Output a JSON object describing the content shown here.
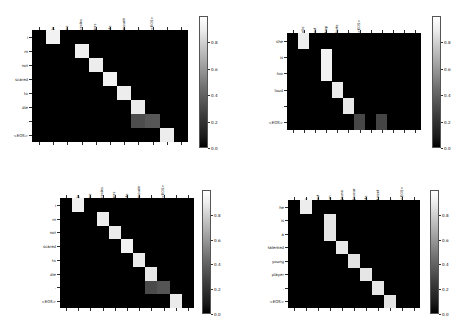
{
  "figure": {
    "type": "attention-heatmap-grid",
    "panels_across": 2,
    "panels_down": 2,
    "background": "#ffffff",
    "colormap": "gray",
    "eos_token": "<EOS>"
  },
  "colorbar": {
    "ticks": [
      "0.0",
      "0.2",
      "0.4",
      "0.6",
      "0.8"
    ],
    "tick_values": [
      0.0,
      0.2,
      0.4,
      0.6,
      0.8
    ],
    "vmin": 0.0,
    "vmax": 1.0,
    "low_color": "#000000",
    "high_color": "#ffffff"
  },
  "chart_data": [
    {
      "id": "panel-top-left",
      "type": "heatmap",
      "title": "",
      "xlabel": "",
      "ylabel": "",
      "x_tick_labels": [
        "je",
        "ne",
        "crains",
        "pas",
        "de",
        "mourir",
        ",",
        "<EOS>",
        "",
        "",
        ""
      ],
      "y_tick_labels": [
        "i",
        "m",
        "not",
        "scared",
        "to",
        "die",
        ".",
        "<EOS>"
      ],
      "n_cols": 11,
      "n_rows": 8,
      "values": [
        [
          0.02,
          0.95,
          0.02,
          0.01,
          0.01,
          0.01,
          0.01,
          0.01,
          0.01,
          0.01,
          0.01
        ],
        [
          0.01,
          0.02,
          0.02,
          0.94,
          0.01,
          0.01,
          0.01,
          0.01,
          0.01,
          0.01,
          0.01
        ],
        [
          0.01,
          0.01,
          0.02,
          0.03,
          0.93,
          0.01,
          0.01,
          0.01,
          0.01,
          0.01,
          0.01
        ],
        [
          0.01,
          0.01,
          0.01,
          0.02,
          0.03,
          0.95,
          0.01,
          0.01,
          0.01,
          0.01,
          0.01
        ],
        [
          0.01,
          0.01,
          0.01,
          0.01,
          0.02,
          0.03,
          0.93,
          0.01,
          0.01,
          0.01,
          0.01
        ],
        [
          0.01,
          0.01,
          0.01,
          0.01,
          0.01,
          0.02,
          0.03,
          0.92,
          0.01,
          0.01,
          0.01
        ],
        [
          0.01,
          0.01,
          0.01,
          0.01,
          0.01,
          0.01,
          0.02,
          0.3,
          0.34,
          0.01,
          0.01
        ],
        [
          0.01,
          0.01,
          0.01,
          0.01,
          0.01,
          0.01,
          0.01,
          0.02,
          0.03,
          0.93,
          0.01
        ]
      ],
      "cells": [
        {
          "r": 0,
          "c": 1,
          "v": 0.95
        },
        {
          "r": 1,
          "c": 3,
          "v": 0.94
        },
        {
          "r": 2,
          "c": 4,
          "v": 0.93
        },
        {
          "r": 3,
          "c": 5,
          "v": 0.95
        },
        {
          "r": 4,
          "c": 6,
          "v": 0.93
        },
        {
          "r": 5,
          "c": 7,
          "v": 0.92
        },
        {
          "r": 6,
          "c": 7,
          "v": 0.3
        },
        {
          "r": 6,
          "c": 8,
          "v": 0.34
        },
        {
          "r": 7,
          "c": 9,
          "v": 0.93
        }
      ],
      "x_label_cols": [
        1,
        2,
        3,
        4,
        5,
        6,
        7,
        8
      ]
    },
    {
      "id": "panel-top-right",
      "type": "heatmap",
      "title": "",
      "xlabel": "",
      "ylabel": "",
      "x_tick_labels": [
        "elle",
        "est",
        "trop",
        "forte",
        ",",
        "<EOS>",
        "",
        "",
        "",
        "",
        "",
        ""
      ],
      "y_tick_labels": [
        "she",
        "is",
        "too",
        "loud",
        ".",
        "<EOS>"
      ],
      "n_cols": 12,
      "n_rows": 6,
      "values": [
        [
          0.02,
          0.93,
          0.02,
          0.01,
          0.01,
          0.01,
          0.01,
          0.01,
          0.01,
          0.01,
          0.01,
          0.01
        ],
        [
          0.01,
          0.02,
          0.02,
          0.95,
          0.01,
          0.01,
          0.01,
          0.01,
          0.01,
          0.01,
          0.01,
          0.01
        ],
        [
          0.01,
          0.01,
          0.02,
          0.95,
          0.01,
          0.01,
          0.01,
          0.01,
          0.01,
          0.01,
          0.01,
          0.01
        ],
        [
          0.01,
          0.01,
          0.01,
          0.02,
          0.92,
          0.01,
          0.01,
          0.01,
          0.01,
          0.01,
          0.01,
          0.01
        ],
        [
          0.01,
          0.01,
          0.01,
          0.01,
          0.02,
          0.91,
          0.01,
          0.01,
          0.01,
          0.01,
          0.01,
          0.01
        ],
        [
          0.01,
          0.01,
          0.01,
          0.01,
          0.01,
          0.02,
          0.28,
          0.01,
          0.27,
          0.01,
          0.01,
          0.01
        ]
      ],
      "cells": [
        {
          "r": 0,
          "c": 1,
          "v": 0.93
        },
        {
          "r": 1,
          "c": 3,
          "v": 0.95,
          "rowspan": 2
        },
        {
          "r": 3,
          "c": 4,
          "v": 0.92
        },
        {
          "r": 4,
          "c": 5,
          "v": 0.91
        },
        {
          "r": 5,
          "c": 6,
          "v": 0.28
        },
        {
          "r": 5,
          "c": 8,
          "v": 0.27
        }
      ],
      "x_label_cols": [
        1,
        2,
        3,
        4,
        5,
        6
      ]
    },
    {
      "id": "panel-bottom-left",
      "type": "heatmap",
      "title": "",
      "xlabel": "",
      "ylabel": "",
      "x_tick_labels": [
        "je",
        "ne",
        "crains",
        "pas",
        "de",
        "mourir",
        ",",
        "<EOS>",
        "",
        "",
        ""
      ],
      "y_tick_labels": [
        "i",
        "m",
        "not",
        "scared",
        "to",
        "die",
        ".",
        "<EOS>"
      ],
      "n_cols": 11,
      "n_rows": 8,
      "values": [
        [
          0.02,
          0.94,
          0.02,
          0.01,
          0.01,
          0.01,
          0.01,
          0.01,
          0.01,
          0.01,
          0.01
        ],
        [
          0.01,
          0.02,
          0.02,
          0.93,
          0.01,
          0.01,
          0.01,
          0.01,
          0.01,
          0.01,
          0.01
        ],
        [
          0.01,
          0.01,
          0.02,
          0.03,
          0.92,
          0.01,
          0.01,
          0.01,
          0.01,
          0.01,
          0.01
        ],
        [
          0.01,
          0.01,
          0.01,
          0.02,
          0.03,
          0.95,
          0.01,
          0.01,
          0.01,
          0.01,
          0.01
        ],
        [
          0.01,
          0.01,
          0.01,
          0.01,
          0.02,
          0.03,
          0.92,
          0.01,
          0.01,
          0.01,
          0.01
        ],
        [
          0.01,
          0.01,
          0.01,
          0.01,
          0.01,
          0.02,
          0.03,
          0.91,
          0.01,
          0.01,
          0.01
        ],
        [
          0.01,
          0.01,
          0.01,
          0.01,
          0.01,
          0.01,
          0.02,
          0.29,
          0.33,
          0.01,
          0.01
        ],
        [
          0.01,
          0.01,
          0.01,
          0.01,
          0.01,
          0.01,
          0.01,
          0.02,
          0.03,
          0.92,
          0.01
        ]
      ],
      "cells": [
        {
          "r": 0,
          "c": 1,
          "v": 0.94
        },
        {
          "r": 1,
          "c": 3,
          "v": 0.93
        },
        {
          "r": 2,
          "c": 4,
          "v": 0.92
        },
        {
          "r": 3,
          "c": 5,
          "v": 0.95
        },
        {
          "r": 4,
          "c": 6,
          "v": 0.92
        },
        {
          "r": 5,
          "c": 7,
          "v": 0.91
        },
        {
          "r": 6,
          "c": 7,
          "v": 0.29
        },
        {
          "r": 6,
          "c": 8,
          "v": 0.33
        },
        {
          "r": 7,
          "c": 9,
          "v": 0.92
        }
      ],
      "x_label_cols": [
        1,
        2,
        3,
        4,
        5,
        6,
        7,
        8
      ]
    },
    {
      "id": "panel-bottom-right",
      "type": "heatmap",
      "title": "",
      "xlabel": "",
      "ylabel": "",
      "x_tick_labels": [
        "c",
        "est",
        "un",
        "jeune",
        "joueur",
        "de",
        "talent",
        ",",
        "<EOS>",
        "",
        ""
      ],
      "y_tick_labels": [
        "he",
        "is",
        "a",
        "talented",
        "young",
        "player",
        ".",
        "<EOS>"
      ],
      "n_cols": 11,
      "n_rows": 8,
      "values": [
        [
          0.02,
          0.93,
          0.02,
          0.01,
          0.01,
          0.01,
          0.01,
          0.01,
          0.01,
          0.01,
          0.01
        ],
        [
          0.01,
          0.02,
          0.02,
          0.9,
          0.01,
          0.01,
          0.01,
          0.01,
          0.01,
          0.01,
          0.01
        ],
        [
          0.01,
          0.01,
          0.02,
          0.9,
          0.01,
          0.01,
          0.01,
          0.01,
          0.01,
          0.01,
          0.01
        ],
        [
          0.01,
          0.01,
          0.01,
          0.02,
          0.91,
          0.01,
          0.01,
          0.01,
          0.01,
          0.01,
          0.01
        ],
        [
          0.01,
          0.01,
          0.01,
          0.01,
          0.02,
          0.89,
          0.01,
          0.01,
          0.01,
          0.01,
          0.01
        ],
        [
          0.01,
          0.01,
          0.01,
          0.01,
          0.01,
          0.02,
          0.9,
          0.01,
          0.01,
          0.01,
          0.01
        ],
        [
          0.01,
          0.01,
          0.01,
          0.01,
          0.01,
          0.01,
          0.02,
          0.9,
          0.01,
          0.01,
          0.01
        ],
        [
          0.01,
          0.01,
          0.01,
          0.01,
          0.01,
          0.01,
          0.01,
          0.02,
          0.89,
          0.01,
          0.01
        ]
      ],
      "cells": [
        {
          "r": 0,
          "c": 1,
          "v": 0.93
        },
        {
          "r": 1,
          "c": 3,
          "v": 0.9,
          "rowspan": 2
        },
        {
          "r": 3,
          "c": 4,
          "v": 0.91
        },
        {
          "r": 4,
          "c": 5,
          "v": 0.89
        },
        {
          "r": 5,
          "c": 6,
          "v": 0.9
        },
        {
          "r": 6,
          "c": 7,
          "v": 0.9
        },
        {
          "r": 7,
          "c": 8,
          "v": 0.89
        }
      ],
      "x_label_cols": [
        1,
        2,
        3,
        4,
        5,
        6,
        7,
        8,
        9
      ]
    }
  ]
}
